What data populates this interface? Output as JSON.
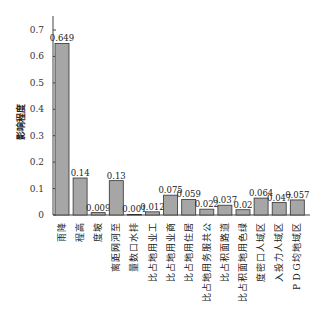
{
  "chart_data": {
    "type": "bar",
    "title": "",
    "xlabel": "",
    "ylabel": "影响程度",
    "ylim": [
      0,
      0.7
    ],
    "yticks": [
      0,
      0.1,
      0.2,
      0.3,
      0.4,
      0.5,
      0.6,
      0.7
    ],
    "grid": false,
    "bar_color": "#a6a6a6",
    "bar_edge_color": "#333333",
    "categories": [
      "降雨",
      "高程",
      "坡度",
      "至河网距离",
      "排水口数量",
      "工业用地占比",
      "商业用地占比",
      "居住用地占比",
      "公共服务用地占比",
      "道路面积占比",
      "绿色用地面积占比",
      "区域人口密度",
      "区域人力投入",
      "区域地均GDP"
    ],
    "values": [
      0.649,
      0.14,
      0.009,
      0.13,
      0.001,
      0.012,
      0.075,
      0.059,
      0.022,
      0.037,
      0.02,
      0.064,
      0.047,
      0.057
    ],
    "value_labels": [
      "0.649",
      "0.14",
      "0.009",
      "0.13",
      "0.001",
      "0.012",
      "0.075",
      "0.059",
      "0.022",
      "0.037",
      "0.02",
      "0.064",
      "0.047",
      "0.057"
    ]
  }
}
